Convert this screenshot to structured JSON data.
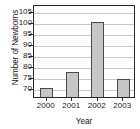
{
  "chart_data": {
    "type": "bar",
    "title": "",
    "subtitle": "",
    "xlabel": "Year",
    "ylabel": "Number of Newborns",
    "categories": [
      "2000",
      "2001",
      "2002",
      "2003"
    ],
    "values": [
      71,
      78,
      101,
      75
    ],
    "series": [
      {
        "name": "Number of Newborns",
        "values": [
          71,
          78,
          101,
          75
        ]
      }
    ],
    "yticks": [
      70,
      75,
      80,
      85,
      90,
      95,
      100,
      105
    ],
    "ylim": [
      66,
      108
    ],
    "grid": true,
    "grid_axis": "y",
    "legend": false,
    "legend_position": "none",
    "bar_fill_color": "#c6c6c6",
    "bar_edge_color": "#4a4a4a",
    "grid_color": "#c9c9c9",
    "axis_color": "#2b2b2b"
  }
}
